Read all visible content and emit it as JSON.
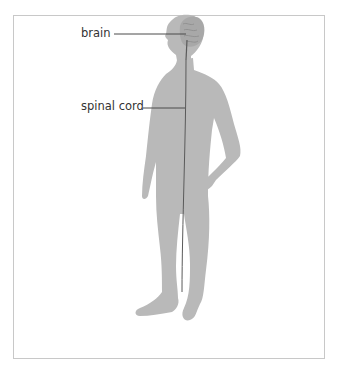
{
  "diagram": {
    "labels": {
      "brain": "brain",
      "spinal_cord": "spinal cord"
    },
    "colors": {
      "body": "#b9b9b9",
      "brain": "#a8a8a8",
      "leader_line": "#4a4a4a",
      "frame": "#c8c8c8",
      "text": "#333333"
    }
  }
}
